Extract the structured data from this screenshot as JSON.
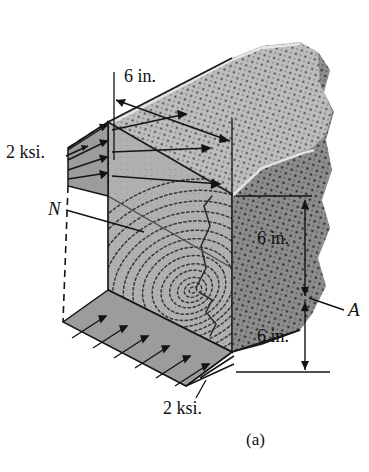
{
  "figure": {
    "kind": "engineering-diagram",
    "caption": "(a)",
    "colors": {
      "top_face": "#bdbdbd",
      "front_face": "#ababab",
      "right_face": "#8d8d8d",
      "stress_fill": "#9e9e9e",
      "line": "#151515",
      "background": "#ffffff",
      "grain_dot": "#3a3a3a"
    }
  },
  "labels": {
    "dim_top": "6 in.",
    "dim_right_upper": "6 in.",
    "dim_right_lower": "6 in.",
    "stress_top": "2 ksi.",
    "stress_bottom": "2 ksi.",
    "force_n": "N",
    "area_a": "A",
    "caption": "(a)"
  },
  "dimensions": [
    {
      "name": "top-width",
      "value": "6 in."
    },
    {
      "name": "right-upper-height",
      "value": "6 in."
    },
    {
      "name": "right-lower-height",
      "value": "6 in."
    }
  ],
  "annotations": [
    {
      "name": "stress-top",
      "text": "2 ksi."
    },
    {
      "name": "normal-force",
      "text": "N"
    },
    {
      "name": "area",
      "text": "A"
    },
    {
      "name": "stress-bottom",
      "text": "2 ksi."
    }
  ]
}
